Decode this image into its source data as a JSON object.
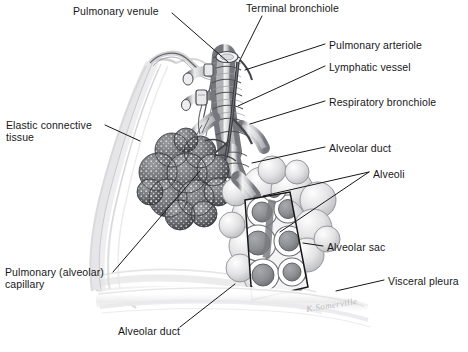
{
  "figure": {
    "style": "grayscale pen-and-ink / airbrush medical illustration",
    "background_color": "#ffffff",
    "ink_color": "#17171a",
    "signature": "K.Somerville"
  },
  "labels": [
    {
      "id": "pulmonary-venule",
      "text": "Pulmonary venule",
      "x": 73,
      "y": 5,
      "align": "left"
    },
    {
      "id": "terminal-bronchiole",
      "text": "Terminal bronchiole",
      "x": 246,
      "y": 2,
      "align": "left"
    },
    {
      "id": "pulmonary-arteriole",
      "text": "Pulmonary arteriole",
      "x": 329,
      "y": 39,
      "align": "left"
    },
    {
      "id": "lymphatic-vessel",
      "text": "Lymphatic vessel",
      "x": 329,
      "y": 61,
      "align": "left"
    },
    {
      "id": "respiratory-bronchiole",
      "text": "Respiratory bronchiole",
      "x": 329,
      "y": 96,
      "align": "left"
    },
    {
      "id": "elastic-connective-tissue",
      "text": "Elastic connective\ntissue",
      "x": 6,
      "y": 119,
      "align": "left"
    },
    {
      "id": "alveolar-duct-right",
      "text": "Alveolar duct",
      "x": 329,
      "y": 142,
      "align": "left"
    },
    {
      "id": "alveoli",
      "text": "Alveoli",
      "x": 373,
      "y": 168,
      "align": "left"
    },
    {
      "id": "alveolar-sac",
      "text": "Alveolar sac",
      "x": 327,
      "y": 241,
      "align": "left"
    },
    {
      "id": "visceral-pleura",
      "text": "Visceral pleura",
      "x": 388,
      "y": 275,
      "align": "left"
    },
    {
      "id": "pulmonary-alveolar-capillary",
      "text": "Pulmonary (alveolar)\ncapillary",
      "x": 5,
      "y": 266,
      "align": "left"
    },
    {
      "id": "alveolar-duct-bottom",
      "text": "Alveolar duct",
      "x": 118,
      "y": 325,
      "align": "left"
    }
  ],
  "leader_lines": [
    {
      "id": "leader-pulmonary-venule",
      "points": "172,13 228,62"
    },
    {
      "id": "leader-terminal-bronchiole",
      "points": "262,16 239,62"
    },
    {
      "id": "leader-pulmonary-arteriole",
      "points": "325,44 245,70"
    },
    {
      "id": "leader-lymphatic-vessel",
      "points": "325,66 238,106"
    },
    {
      "id": "leader-respiratory-bronchiole",
      "points": "325,101 250,124"
    },
    {
      "id": "leader-elastic-connective",
      "points": "105,125 140,141"
    },
    {
      "id": "leader-alveolar-duct-right",
      "points": "325,147 252,163"
    },
    {
      "id": "leader-alveoli-a",
      "points": "369,172 263,196"
    },
    {
      "id": "leader-alveoli-b",
      "points": "369,172 280,232"
    },
    {
      "id": "leader-alveolar-sac",
      "points": "323,246 303,243"
    },
    {
      "id": "leader-visceral-pleura",
      "points": "384,280 336,291"
    },
    {
      "id": "leader-capillary",
      "points": "113,272 200,171"
    },
    {
      "id": "leader-alveolar-duct-bottom",
      "points": "180,327 235,284"
    }
  ],
  "structures": [
    {
      "id": "terminal-bronchiole",
      "description": "central cartilaginous airway running vertically down the middle of the figure"
    },
    {
      "id": "respiratory-bronchiole",
      "description": "branching airway below the terminal bronchiole"
    },
    {
      "id": "pulmonary-arteriole",
      "description": "dark vessel descending alongside the bronchiole"
    },
    {
      "id": "pulmonary-venule",
      "description": "vessel arching from upper left into the bronchial tree"
    },
    {
      "id": "lymphatic-vessel",
      "description": "small beaded vessel on the bronchiole wall"
    },
    {
      "id": "elastic-connective-tissue",
      "description": "pale fibrous sheets sweeping down the left of the figure"
    },
    {
      "id": "capillary-network",
      "description": "dark stippled alveolar cluster at left showing the pulmonary capillary mesh"
    },
    {
      "id": "alveolar-cluster",
      "description": "large pale grape-like cluster of alveoli at lower right"
    },
    {
      "id": "alveolar-sac-cutaway",
      "description": "tilted rectangular cut-away window revealing hollow alveoli in section"
    },
    {
      "id": "visceral-pleura",
      "description": "pale layered membrane band sweeping across the bottom"
    }
  ]
}
